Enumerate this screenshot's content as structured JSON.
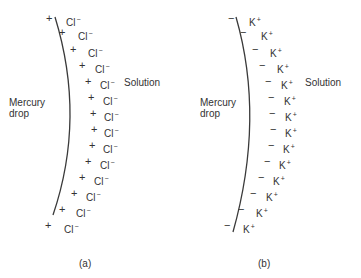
{
  "panels": [
    {
      "id": "a",
      "caption": "(a)",
      "left_label": [
        "Mercury",
        "drop"
      ],
      "right_label": "Solution",
      "electrode_sign": "+",
      "ion_symbol": "Cl",
      "ion_charge": "−",
      "curve": "M55,17 Q86,118 53,215",
      "rows": [
        {
          "y": 19,
          "sx": 46,
          "ix": 66
        },
        {
          "y": 33,
          "sx": 59,
          "ix": 78
        },
        {
          "y": 50,
          "sx": 70,
          "ix": 88
        },
        {
          "y": 66,
          "sx": 79,
          "ix": 95
        },
        {
          "y": 82,
          "sx": 85,
          "ix": 100
        },
        {
          "y": 98,
          "sx": 88,
          "ix": 103
        },
        {
          "y": 114,
          "sx": 90,
          "ix": 104
        },
        {
          "y": 130,
          "sx": 91,
          "ix": 104
        },
        {
          "y": 146,
          "sx": 89,
          "ix": 103
        },
        {
          "y": 162,
          "sx": 85,
          "ix": 100
        },
        {
          "y": 178,
          "sx": 79,
          "ix": 94
        },
        {
          "y": 194,
          "sx": 71,
          "ix": 86
        },
        {
          "y": 210,
          "sx": 59,
          "ix": 76
        },
        {
          "y": 226,
          "sx": 45,
          "ix": 64
        }
      ]
    },
    {
      "id": "b",
      "caption": "(b)",
      "left_label": [
        "Mercury",
        "drop"
      ],
      "right_label": "Solution",
      "electrode_sign": "−",
      "ion_symbol": "K",
      "ion_charge": "+",
      "curve": "M236,17 Q265,118 233,232",
      "rows": [
        {
          "y": 19,
          "sx": 228,
          "ix": 249
        },
        {
          "y": 33,
          "sx": 240,
          "ix": 261
        },
        {
          "y": 50,
          "sx": 252,
          "ix": 270
        },
        {
          "y": 66,
          "sx": 259,
          "ix": 277
        },
        {
          "y": 82,
          "sx": 265,
          "ix": 281
        },
        {
          "y": 98,
          "sx": 268,
          "ix": 284
        },
        {
          "y": 114,
          "sx": 269,
          "ix": 285
        },
        {
          "y": 130,
          "sx": 270,
          "ix": 285
        },
        {
          "y": 146,
          "sx": 268,
          "ix": 283
        },
        {
          "y": 162,
          "sx": 264,
          "ix": 279
        },
        {
          "y": 178,
          "sx": 258,
          "ix": 273
        },
        {
          "y": 194,
          "sx": 250,
          "ix": 266
        },
        {
          "y": 210,
          "sx": 238,
          "ix": 256
        },
        {
          "y": 226,
          "sx": 224,
          "ix": 243
        }
      ]
    }
  ]
}
